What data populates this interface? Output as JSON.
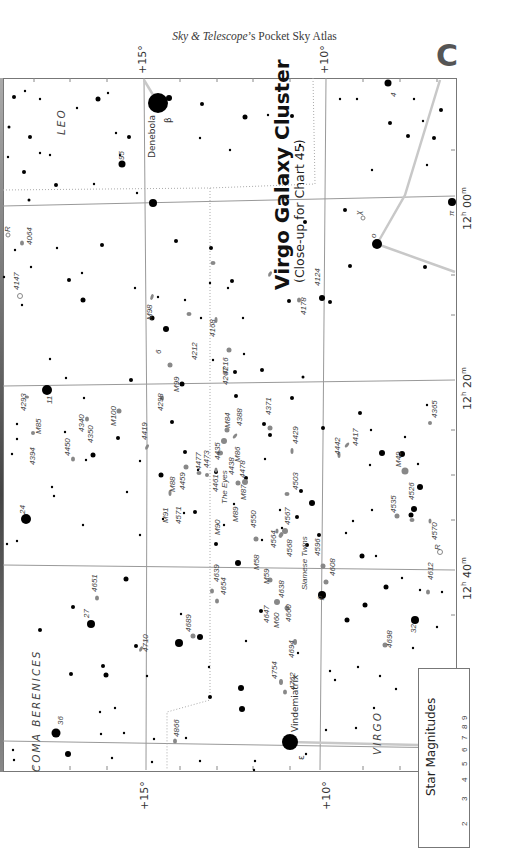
{
  "header": {
    "title_italic": "Sky & Telescope",
    "title_rest": "’s Pocket Sky Atlas",
    "chart_letter": "C"
  },
  "map": {
    "title": "Virgo Galaxy Cluster",
    "subtitle": "(Close-up for Chart 45)",
    "declination_labels": {
      "top_left": "+15°",
      "top_right": "+10°",
      "bottom_left": "+15°",
      "bottom_right": "+10°"
    },
    "ra_labels": [
      {
        "label": "12h 00m",
        "hour": "12",
        "min": "00"
      },
      {
        "label": "12h 20m",
        "hour": "12",
        "min": "20"
      },
      {
        "label": "12h 40m",
        "hour": "12",
        "min": "40"
      }
    ],
    "constellations": [
      "LEO",
      "COMA BERENICES",
      "VIRGO"
    ],
    "named_stars": [
      {
        "name": "Denebola",
        "greek": "β"
      },
      {
        "name": "Vindemiatrix",
        "greek": "ε"
      }
    ],
    "star_labels": [
      "95",
      "6",
      "11",
      "24",
      "27",
      "36",
      "4",
      "32",
      "π",
      "ο",
      "χ",
      "ρ",
      "R",
      "R"
    ],
    "objects": [
      "4064",
      "4147",
      "M98",
      "4168",
      "4212",
      "4216",
      "4267",
      "M99",
      "4124",
      "4178",
      "4293",
      "M85",
      "4394",
      "4450",
      "4340",
      "4350",
      "M100",
      "4419",
      "4298",
      "M88",
      "4459",
      "4477",
      "4473",
      "4461",
      "The Eyes",
      "4435",
      "4438",
      "M84",
      "M86",
      "4388",
      "M87",
      "4478",
      "M91",
      "4571",
      "M90",
      "M89",
      "4550",
      "4371",
      "4429",
      "4503",
      "4442",
      "4417",
      "4365",
      "M49",
      "4526",
      "4535",
      "4570",
      "4567",
      "4564",
      "M58",
      "4568",
      "Siamese Twins",
      "4596",
      "4608",
      "M59",
      "4638",
      "4647",
      "M60",
      "4660",
      "4694",
      "4612",
      "4698",
      "4754",
      "4762",
      "4651",
      "4639",
      "4654",
      "4689",
      "4710",
      "4866"
    ]
  },
  "legend": {
    "title": "Star Magnitudes",
    "magnitudes": [
      "2",
      "3",
      "4",
      "5",
      "6",
      "7",
      "8",
      "9"
    ]
  }
}
